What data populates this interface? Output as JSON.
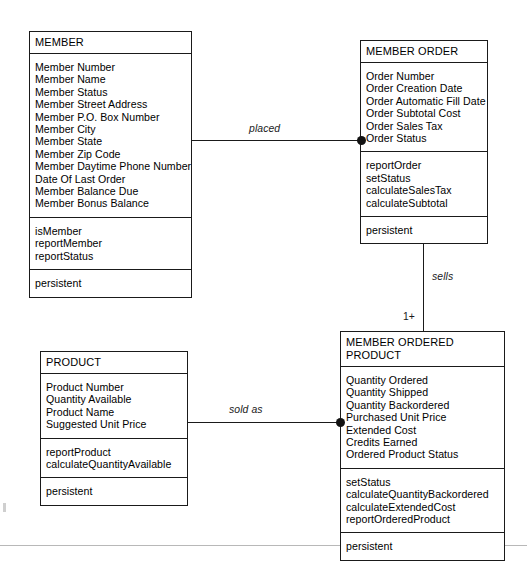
{
  "diagram": {
    "type": "uml-class-diagram",
    "title_artifact": "",
    "classes": [
      {
        "id": "member",
        "name": "MEMBER",
        "attributes": [
          "Member Number",
          "Member Name",
          "Member Status",
          "Member Street Address",
          "Member P.O. Box Number",
          "Member City",
          "Member State",
          "Member Zip Code",
          "Member Daytime Phone Number",
          "Date Of Last Order",
          "Member Balance Due",
          "Member Bonus Balance"
        ],
        "operations": [
          "isMember",
          "reportMember",
          "reportStatus"
        ],
        "properties": [
          "persistent"
        ]
      },
      {
        "id": "member_order",
        "name": "MEMBER ORDER",
        "attributes": [
          "Order Number",
          "Order Creation Date",
          "Order Automatic Fill Date",
          "Order Subtotal Cost",
          "Order Sales Tax",
          "Order Status"
        ],
        "operations": [
          "reportOrder",
          "setStatus",
          "calculateSalesTax",
          "calculateSubtotal"
        ],
        "properties": [
          "persistent"
        ]
      },
      {
        "id": "member_ordered_product",
        "name": "MEMBER ORDERED PRODUCT",
        "attributes": [
          "Quantity Ordered",
          "Quantity Shipped",
          "Quantity Backordered",
          "Purchased Unit Price",
          "Extended Cost",
          "Credits Earned",
          "Ordered Product Status"
        ],
        "operations": [
          "setStatus",
          "calculateQuantityBackordered",
          "calculateExtendedCost",
          "reportOrderedProduct"
        ],
        "properties": [
          "persistent"
        ]
      },
      {
        "id": "product",
        "name": "PRODUCT",
        "attributes": [
          "Product Number",
          "Quantity Available",
          "Product Name",
          "Suggested Unit Price"
        ],
        "operations": [
          "reportProduct",
          "calculateQuantityAvailable"
        ],
        "properties": [
          "persistent"
        ]
      }
    ],
    "associations": [
      {
        "id": "placed",
        "label": "placed",
        "from": "member",
        "to": "member_order",
        "multiplicity": ""
      },
      {
        "id": "sells",
        "label": "sells",
        "from": "member_order",
        "to": "member_ordered_product",
        "multiplicity": "1+"
      },
      {
        "id": "sold_as",
        "label": "sold as",
        "from": "product",
        "to": "member_ordered_product",
        "multiplicity": ""
      }
    ],
    "colors": {
      "stroke": "#1a1a1a",
      "fill": "#ffffff",
      "text": "#000000"
    }
  }
}
